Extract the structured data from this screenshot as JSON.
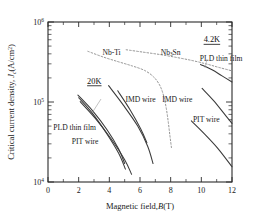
{
  "chart_data": {
    "type": "line",
    "title": "",
    "xlabel": "Magnetic field,B(T)",
    "ylabel": "Critical current density, Jc(A/cm2)",
    "xlabel_parts": {
      "lead": "Magnetic field,",
      "symbol": "B",
      "unit": "(T)"
    },
    "ylabel_parts": {
      "lead": "Critical current density, ",
      "symbol": "J",
      "symbol_sub": "c",
      "unit_open": "(A/cm",
      "unit_sup": "2",
      "unit_close": ")"
    },
    "xlim": [
      0,
      12
    ],
    "ylim": [
      10000,
      1000000
    ],
    "yscale": "log",
    "xscale": "linear",
    "grid": false,
    "legend_position": "inline-annotations",
    "xticks": [
      0,
      2,
      4,
      6,
      8,
      10,
      12
    ],
    "xtick_labels": [
      "0",
      "2",
      "4",
      "6",
      "8",
      "10",
      "12"
    ],
    "yticks": [
      10000,
      100000,
      1000000
    ],
    "ytick_labels": [
      "104",
      "105",
      "106"
    ],
    "ytick_mantissa": "10",
    "ytick_exponents": [
      "4",
      "5",
      "6"
    ],
    "annotations": [
      {
        "name": "temp-4p2k",
        "text": "4.2K",
        "underlined": true,
        "x": 10.15,
        "y": 560000
      },
      {
        "name": "temp-20k",
        "text": "20K",
        "underlined": true,
        "x": 2.55,
        "y": 170000
      },
      {
        "name": "label-nbti",
        "text": "Nb-Ti",
        "x": 3.55,
        "y": 392000
      },
      {
        "name": "label-nb3sn",
        "text": "Nb",
        "sub": "3",
        "text2": "Sn",
        "x": 7.35,
        "y": 392000
      },
      {
        "name": "label-pld-thin-film-4p2k",
        "text": "PLD thin film",
        "x": 9.9,
        "y": 330000
      },
      {
        "name": "label-imd-wire-20k",
        "text": "IMD wire",
        "x": 5.05,
        "y": 101000
      },
      {
        "name": "label-imd-wire-4p2k",
        "text": "IMD wire",
        "x": 7.45,
        "y": 101000
      },
      {
        "name": "label-pit-wire-4p2k",
        "text": "PIT wire",
        "x": 9.45,
        "y": 57000
      },
      {
        "name": "label-pld-thin-film-20k",
        "text": "PLD thin film",
        "x": 0.35,
        "y": 45000
      },
      {
        "name": "label-pit-wire-20k",
        "text": "PIT wire",
        "x": 1.55,
        "y": 30000
      }
    ],
    "series": [
      {
        "name": "Nb-Ti",
        "style": "dashed",
        "color": "#8d8d8d",
        "temperature": "4.2K",
        "points": [
          [
            2.6,
            430000
          ],
          [
            3.6,
            365000
          ],
          [
            4.6,
            318000
          ],
          [
            5.5,
            282000
          ],
          [
            6.3,
            248000
          ],
          [
            6.9,
            205000
          ],
          [
            7.3,
            160000
          ],
          [
            7.55,
            118000
          ],
          [
            7.72,
            82000
          ],
          [
            7.85,
            55000
          ],
          [
            7.95,
            38000
          ],
          [
            8.05,
            27000
          ]
        ]
      },
      {
        "name": "Nb3Sn",
        "style": "dashed",
        "color": "#8d8d8d",
        "temperature": "4.2K",
        "points": [
          [
            5.1,
            450000
          ],
          [
            6.2,
            420000
          ],
          [
            7.3,
            392000
          ],
          [
            8.4,
            360000
          ],
          [
            9.4,
            330000
          ],
          [
            10.3,
            300000
          ],
          [
            11.1,
            272000
          ],
          [
            12.0,
            245000
          ]
        ]
      },
      {
        "name": "PLD thin film",
        "style": "solid",
        "color": "#3a3a3a",
        "temperature": "20K",
        "points": [
          [
            1.95,
            122000
          ],
          [
            2.9,
            78000
          ],
          [
            3.85,
            45000
          ],
          [
            4.6,
            26000
          ],
          [
            5.0,
            17000
          ]
        ]
      },
      {
        "name": "PIT wire",
        "style": "solid",
        "color": "#3a3a3a",
        "temperature": "20K",
        "points": [
          [
            2.0,
            113000
          ],
          [
            2.9,
            72000
          ],
          [
            3.8,
            41000
          ],
          [
            4.6,
            23000
          ],
          [
            5.05,
            14500
          ]
        ]
      },
      {
        "name": "PIT wire 2",
        "style": "solid",
        "color": "#3a3a3a",
        "temperature": "20K",
        "points": [
          [
            2.1,
            101000
          ],
          [
            3.1,
            62000
          ],
          [
            4.1,
            35000
          ],
          [
            5.0,
            19000
          ],
          [
            5.45,
            12500
          ]
        ]
      },
      {
        "name": "IMD wire",
        "style": "solid",
        "color": "#3a3a3a",
        "temperature": "20K",
        "points": [
          [
            3.95,
            160000
          ],
          [
            4.9,
            92000
          ],
          [
            5.85,
            50000
          ],
          [
            6.5,
            28000
          ],
          [
            6.85,
            17000
          ]
        ]
      },
      {
        "name": "IMD wire short",
        "style": "solid",
        "color": "#3a3a3a",
        "temperature": "20K",
        "points": [
          [
            4.55,
            138000
          ],
          [
            5.35,
            80000
          ],
          [
            6.05,
            46000
          ],
          [
            6.45,
            31000
          ]
        ]
      },
      {
        "name": "PLD thin film 4.2K",
        "style": "solid",
        "color": "#3a3a3a",
        "temperature": "4.2K",
        "points": [
          [
            9.95,
            295000
          ],
          [
            10.7,
            253000
          ],
          [
            11.35,
            212000
          ],
          [
            12.0,
            178000
          ]
        ]
      },
      {
        "name": "IMD wire 4.2K",
        "style": "solid",
        "color": "#3a3a3a",
        "temperature": "4.2K",
        "points": [
          [
            10.05,
            148000
          ],
          [
            10.8,
            104000
          ],
          [
            11.45,
            73000
          ],
          [
            12.0,
            54000
          ]
        ]
      },
      {
        "name": "PIT wire 4.2K",
        "style": "solid",
        "color": "#3a3a3a",
        "temperature": "4.2K",
        "points": [
          [
            9.35,
            58000
          ],
          [
            10.2,
            40000
          ],
          [
            11.1,
            26000
          ],
          [
            12.0,
            15500
          ]
        ]
      }
    ]
  }
}
